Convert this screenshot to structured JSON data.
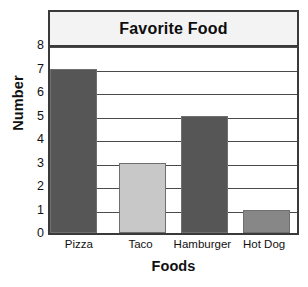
{
  "chart_data": {
    "type": "bar",
    "title": "Favorite Food",
    "xlabel": "Foods",
    "ylabel": "Number",
    "categories": [
      "Pizza",
      "Taco",
      "Hamburger",
      "Hot Dog"
    ],
    "values": [
      7,
      3,
      5,
      1
    ],
    "bar_colors": [
      "#565656",
      "#c8c8c8",
      "#565656",
      "#878787"
    ],
    "ylim": [
      0,
      8
    ],
    "ytick_labels": [
      "8",
      "7",
      "6",
      "5",
      "4",
      "3",
      "2",
      "1",
      "0"
    ],
    "ytick_values": [
      8,
      7,
      6,
      5,
      4,
      3,
      2,
      1,
      0
    ],
    "ystep": 1,
    "grid": "horizontal",
    "legend": "none",
    "title_band_color": "#f3f3f3",
    "frame_color": "#3a3a3a",
    "gridline_color": "#4a4a4a"
  }
}
